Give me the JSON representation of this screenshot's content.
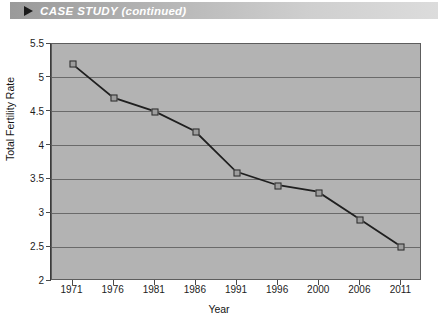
{
  "banner": {
    "icon": "play-triangle-icon",
    "title_main": "CASE STUDY",
    "title_suffix": " (continued)",
    "title_full": "CASE STUDY (continued)",
    "gradient_from": "#9a9a9a",
    "gradient_to": "#dcdcdc",
    "text_color": "#ffffff"
  },
  "chart_data": {
    "type": "line",
    "title": "",
    "xlabel": "Year",
    "ylabel": "Total Fertility Rate",
    "categories": [
      "1971",
      "1976",
      "1981",
      "1986",
      "1991",
      "1996",
      "2000",
      "2006",
      "2011"
    ],
    "values": [
      5.2,
      4.7,
      4.5,
      4.2,
      3.6,
      3.4,
      3.3,
      2.9,
      2.5
    ],
    "x": [
      1971,
      1976,
      1981,
      1986,
      1991,
      1996,
      2000,
      2006,
      2011
    ],
    "ylim": [
      2,
      5.5
    ],
    "yticks": [
      "2",
      "2.5",
      "3",
      "3.5",
      "4",
      "4.5",
      "5",
      "5.5"
    ],
    "ytick_values": [
      2,
      2.5,
      3,
      3.5,
      4,
      4.5,
      5,
      5.5
    ],
    "grid": true,
    "legend": "none",
    "marker": "square",
    "plot_background": "#b3b3b3",
    "gridline_color": "#6a6a6a",
    "line_color": "#1f1f1f",
    "marker_fill": "#9d9d9d",
    "marker_border": "#2b2b2b"
  }
}
